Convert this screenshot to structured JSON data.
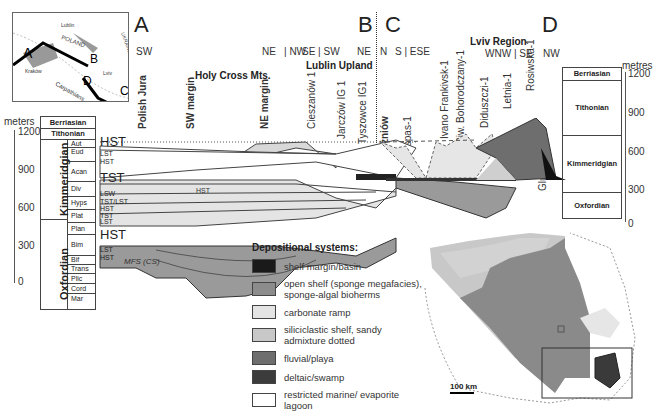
{
  "figure": {
    "section_letters": [
      "A",
      "B",
      "C",
      "D"
    ],
    "directions": {
      "A": [
        "SW"
      ],
      "B": [
        "NE",
        "NW",
        "SE",
        "SW",
        "NE"
      ],
      "C": [
        "N",
        "S",
        "ESE"
      ],
      "D": [
        "WNW",
        "SE",
        "NW"
      ]
    },
    "regions": {
      "holy_cross": "Holy Cross Mts.",
      "lublin": "Lublin Upland",
      "lviv": "Lviv Region"
    },
    "localities": [
      {
        "name": "Polish Jura",
        "bold": true
      },
      {
        "name": "SW margin",
        "bold": true
      },
      {
        "name": "NE margin",
        "bold": true
      },
      {
        "name": "Cieszanów 1",
        "bold": false
      },
      {
        "name": "Jarczów IG 1",
        "bold": false
      },
      {
        "name": "Tyszowce IG1",
        "bold": false
      },
      {
        "name": "Niżniów",
        "bold": true
      },
      {
        "name": "Ispas-1",
        "bold": false
      },
      {
        "name": "Ivano Frankivsk-1",
        "bold": false
      },
      {
        "name": "Piw. Bohorodczany-1",
        "bold": false
      },
      {
        "name": "Diduszczi-1",
        "bold": false
      },
      {
        "name": "Letnia-1",
        "bold": false
      },
      {
        "name": "Rosiwska-1",
        "bold": false
      },
      {
        "name": "Gluhiw-1",
        "bold": false
      }
    ],
    "inset_map": {
      "labels": [
        "Lublin",
        "POLAND",
        "UKRAINE",
        "Kraków",
        "Lviv",
        "Carpathians"
      ],
      "section_points": [
        "A",
        "B",
        "C",
        "D"
      ]
    },
    "left_scale": {
      "unit": "meters",
      "ticks": [
        "1200",
        "900",
        "600",
        "300",
        "0"
      ]
    },
    "right_scale": {
      "unit": "metres",
      "ticks": [
        "1200",
        "900",
        "600",
        "300",
        "0"
      ]
    },
    "left_stratigraphy": {
      "stages_top": [
        "Berriasian",
        "Tithonian"
      ],
      "stages": [
        {
          "name": "Kimmeridgian",
          "zones": [
            "Aut",
            "Eud",
            "Acan",
            "Div",
            "Hyps",
            "Plat"
          ]
        },
        {
          "name": "Oxfordian",
          "zones": [
            "Plan",
            "Bim",
            "Bif",
            "Trans",
            "Plic",
            "Cord",
            "Mar"
          ]
        }
      ],
      "sequences": [
        "HST",
        "LST",
        "HST",
        "TST",
        "LSW",
        "TST/LST",
        "HST",
        "TST",
        "LST",
        "HST",
        "LST",
        "HST"
      ],
      "mfs_label": "MFS (CS)",
      "inner_label": "HST"
    },
    "right_stratigraphy": [
      "Berriasian",
      "Tithonian",
      "Kimmeridgian",
      "Oxfordian"
    ],
    "legend": {
      "title": "Depositional systems:",
      "items": [
        {
          "label": "shelf margin/basin",
          "color": "#1a1a1a"
        },
        {
          "label": "open shelf (sponge megafacies), sponge-algal bioherms",
          "color": "#8c8c8c"
        },
        {
          "label": "carbonate ramp",
          "color": "#e4e4e4"
        },
        {
          "label": "siliciclastic shelf, sandy admixture dotted",
          "color": "#c8c8c8"
        },
        {
          "label": "fluvial/playa",
          "color": "#6e6e6e"
        },
        {
          "label": "deltaic/swamp",
          "color": "#3c3c3c"
        },
        {
          "label": "restricted marine/ evaporite lagoon",
          "color": "#ffffff"
        }
      ]
    },
    "map_scale": "100 km"
  }
}
